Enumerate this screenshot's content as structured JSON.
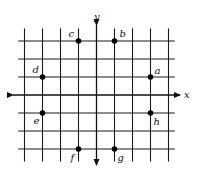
{
  "diagram": {
    "type": "coordinate-grid",
    "axes": {
      "x_label": "x",
      "y_label": "y"
    },
    "grid": {
      "x_range": [
        -4,
        4
      ],
      "y_range": [
        -3,
        3
      ],
      "origin_px": [
        96.5,
        95
      ],
      "unit_px": 18
    },
    "points": [
      {
        "label": "a",
        "x": 3,
        "y": 1
      },
      {
        "label": "b",
        "x": 1,
        "y": 3
      },
      {
        "label": "c",
        "x": -1,
        "y": 3
      },
      {
        "label": "d",
        "x": -3,
        "y": 1
      },
      {
        "label": "e",
        "x": -3,
        "y": -1
      },
      {
        "label": "f",
        "x": -1,
        "y": -3
      },
      {
        "label": "g",
        "x": 1,
        "y": -3
      },
      {
        "label": "h",
        "x": 3,
        "y": -1
      }
    ],
    "colors": {
      "line": "#1a1a1a",
      "point": "#000000",
      "background": "#ffffff"
    }
  }
}
